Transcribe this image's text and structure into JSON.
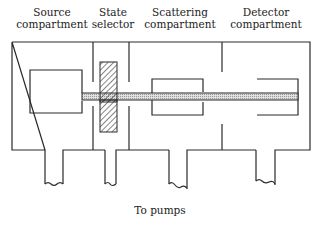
{
  "labels": {
    "source": [
      "Source",
      "compartment"
    ],
    "state": [
      "State",
      "selector"
    ],
    "scattering": [
      "Scattering",
      "compartment"
    ],
    "detector": [
      "Detector",
      "compartment"
    ],
    "pumps": "To pumps"
  },
  "colors": {
    "line": "#2a2a2a",
    "beam_fill": "#c8c8c8",
    "hatch": "#333333",
    "background": "#ffffff"
  }
}
